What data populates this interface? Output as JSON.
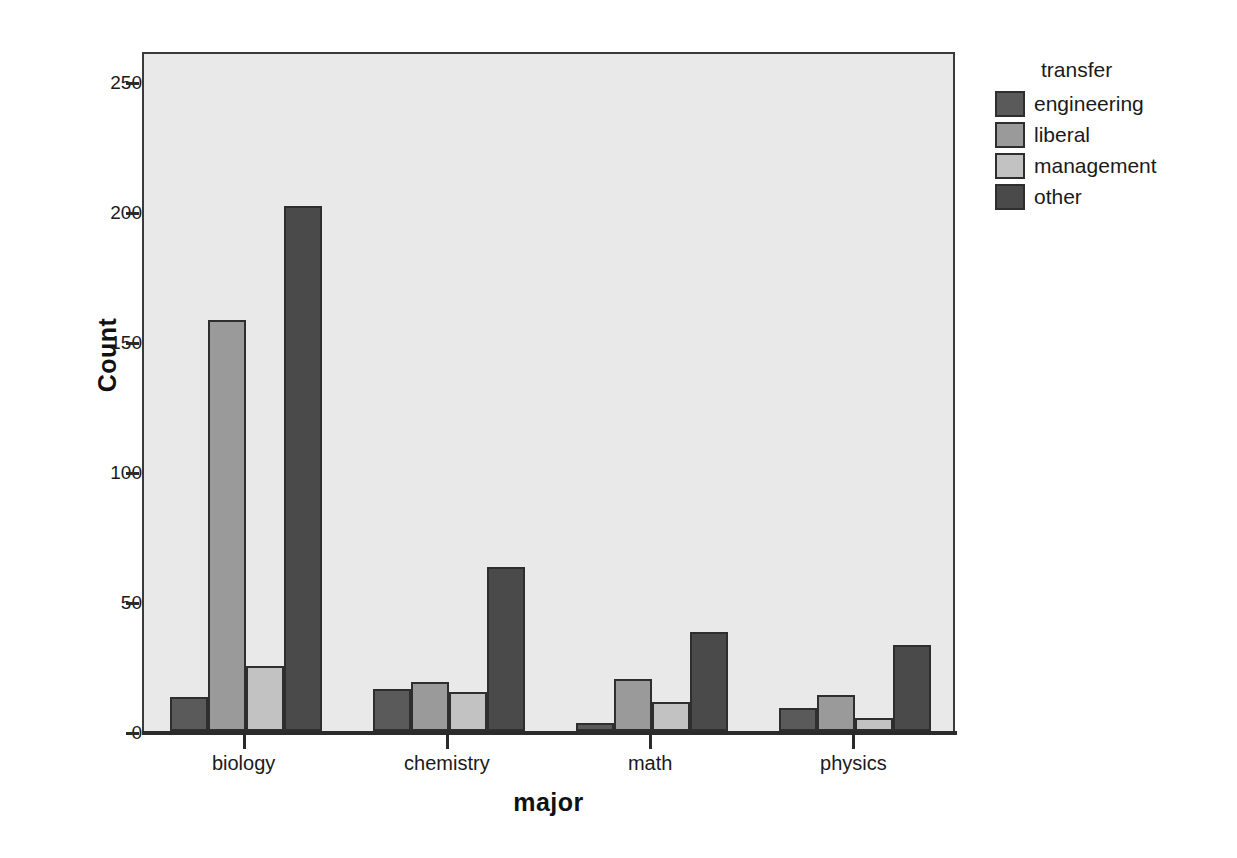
{
  "chart_data": {
    "type": "bar",
    "title": "",
    "xlabel": "major",
    "ylabel": "Count",
    "categories": [
      "biology",
      "chemistry",
      "math",
      "physics"
    ],
    "series": [
      {
        "name": "engineering",
        "color": "#5a5a5a",
        "values": [
          13,
          16,
          3,
          9
        ]
      },
      {
        "name": "liberal",
        "color": "#9a9a9a",
        "values": [
          158,
          19,
          20,
          14
        ]
      },
      {
        "name": "management",
        "color": "#c2c2c2",
        "values": [
          25,
          15,
          11,
          5
        ]
      },
      {
        "name": "other",
        "color": "#4a4a4a",
        "values": [
          202,
          63,
          38,
          33
        ]
      }
    ],
    "legend_title": "transfer",
    "legend_position": "right",
    "ylim": [
      0,
      260
    ],
    "yticks": [
      0,
      50,
      100,
      150,
      200,
      250
    ],
    "ytick_labels": [
      "0",
      "50",
      "100",
      "150",
      "200",
      "250"
    ],
    "grid": false,
    "plot_background": "#e9e9e9",
    "grouped": true
  }
}
